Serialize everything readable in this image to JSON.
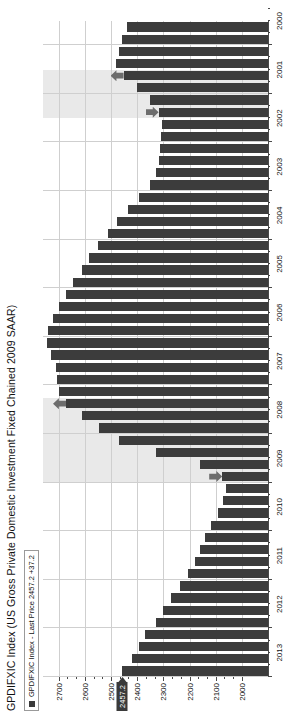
{
  "chart": {
    "title": "GPDIFXIC Index (US Gross Private Domestic Investment Fixed Chained 2009 SAAR)",
    "legend": {
      "label": "GPDIFXIC Index - Last Price 2457.2  +37.2",
      "swatch_color": "#3c3c3c"
    },
    "last_price_flag": "2457.2"
  },
  "chart_data": {
    "type": "bar",
    "orientation": "horizontal",
    "title": "GPDIFXIC Index (US Gross Private Domestic Investment Fixed Chained 2009 SAAR)",
    "xlabel": "",
    "ylabel": "",
    "grid": true,
    "legend_position": "top-left",
    "series": [
      {
        "name": "GPDIFXIC Index - Last Price",
        "last_price": 2457.2,
        "change": 37.2,
        "color": "#3c3c3c"
      }
    ],
    "value_axis": {
      "ticks": [
        2700,
        2600,
        2500,
        2400,
        2300,
        2200,
        2100,
        2000
      ],
      "range": [
        1900,
        2760
      ],
      "minor_ticks_per_interval": 2
    },
    "category_axis": {
      "tick_labels": [
        "2013",
        "2012",
        "2011",
        "2010",
        "2009",
        "2008",
        "2007",
        "2006",
        "2005",
        "2004",
        "2003",
        "2002",
        "2001",
        "2000"
      ],
      "note": "quarterly bars, newest at top"
    },
    "categories": [
      "2013 Q2",
      "2013 Q1",
      "2012 Q4",
      "2012 Q3",
      "2012 Q2",
      "2012 Q1",
      "2011 Q4",
      "2011 Q3",
      "2011 Q2",
      "2011 Q1",
      "2010 Q4",
      "2010 Q3",
      "2010 Q2",
      "2010 Q1",
      "2009 Q4",
      "2009 Q3",
      "2009 Q2",
      "2009 Q1",
      "2008 Q4",
      "2008 Q3",
      "2008 Q2",
      "2008 Q1",
      "2007 Q4",
      "2007 Q3",
      "2007 Q2",
      "2007 Q1",
      "2006 Q4",
      "2006 Q3",
      "2006 Q2",
      "2006 Q1",
      "2005 Q4",
      "2005 Q3",
      "2005 Q2",
      "2005 Q1",
      "2004 Q4",
      "2004 Q3",
      "2004 Q2",
      "2004 Q1",
      "2003 Q4",
      "2003 Q3",
      "2003 Q2",
      "2003 Q1",
      "2002 Q4",
      "2002 Q3",
      "2002 Q2",
      "2002 Q1",
      "2001 Q4",
      "2001 Q3",
      "2001 Q2",
      "2001 Q1",
      "2000 Q4",
      "2000 Q3",
      "2000 Q2",
      "2000 Q1"
    ],
    "values": [
      2457.2,
      2420.0,
      2392.0,
      2370.0,
      2330.0,
      2300.0,
      2272.0,
      2238.0,
      2205.0,
      2178.0,
      2160.0,
      2140.0,
      2118.0,
      2090.0,
      2072.0,
      2060.0,
      2075.0,
      2160.0,
      2330.0,
      2470.0,
      2545.0,
      2610.0,
      2672.0,
      2700.0,
      2705.0,
      2712.0,
      2730.0,
      2745.0,
      2740.0,
      2720.0,
      2700.0,
      2672.0,
      2645.0,
      2612.0,
      2585.0,
      2548.0,
      2512.0,
      2478.0,
      2435.0,
      2395.0,
      2352.0,
      2330.0,
      2318.0,
      2312.0,
      2308.0,
      2305.0,
      2318.0,
      2350.0,
      2400.0,
      2452.0,
      2480.0,
      2470.0,
      2458.0,
      2440.0
    ],
    "shaded_bands": [
      {
        "label": "recession 2007-2009",
        "from": "2007 Q4",
        "to": "2009 Q2"
      },
      {
        "label": "recession 2001",
        "from": "2001 Q1",
        "to": "2001 Q4"
      }
    ],
    "annotations": [
      {
        "type": "arrow-down",
        "at_category": "2009 Q2",
        "meaning": "recession-end-marker"
      },
      {
        "type": "arrow-up",
        "at_category": "2007 Q4",
        "meaning": "recession-start-marker"
      },
      {
        "type": "arrow-down",
        "at_category": "2001 Q4",
        "meaning": "recession-end-marker"
      },
      {
        "type": "arrow-up",
        "at_category": "2001 Q1",
        "meaning": "recession-start-marker"
      }
    ]
  }
}
